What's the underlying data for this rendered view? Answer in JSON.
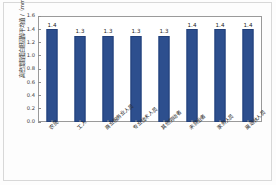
{
  "chart_data": {
    "type": "bar",
    "title": "",
    "xlabel": "",
    "ylabel": "高密度脂蛋白胆固醇平均值 /（mmol/L）",
    "ylim": [
      0.0,
      1.6
    ],
    "yticks": [
      "1.6",
      "1.4",
      "1.2",
      "1.0",
      "0.8",
      "0.6",
      "0.4",
      "0.2",
      "0.0"
    ],
    "grid": false,
    "legend": "none",
    "bar_color": "#2d4f8e",
    "categories": [
      "农民",
      "工人",
      "商业服务业人员",
      "专业技术人员",
      "其他劳动者",
      "未就业者",
      "家务人员",
      "离退休人员"
    ],
    "values": [
      1.4,
      1.3,
      1.3,
      1.3,
      1.3,
      1.4,
      1.4,
      1.4
    ],
    "data_labels": [
      "1.4",
      "1.3",
      "1.3",
      "1.3",
      "1.3",
      "1.4",
      "1.4",
      "1.4"
    ]
  }
}
